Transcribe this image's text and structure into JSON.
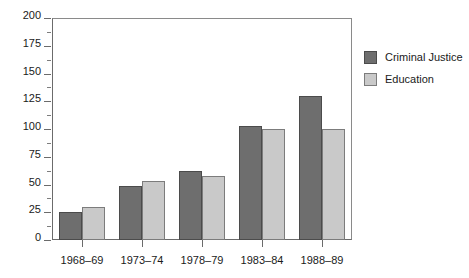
{
  "chart_data": {
    "type": "bar",
    "title": "",
    "subtitle": "",
    "xlabel": "",
    "ylabel": "",
    "ylim": [
      0,
      200
    ],
    "y_ticks": [
      0,
      25,
      50,
      75,
      100,
      125,
      150,
      175,
      200
    ],
    "y_tick_labels": [
      "0",
      "25",
      "50",
      "75",
      "100",
      "125",
      "150",
      "175",
      "200"
    ],
    "y_minor_tick_step": 12.5,
    "grid": false,
    "legend_position": "right",
    "categories": [
      "1968–69",
      "1973–74",
      "1978–79",
      "1983–84",
      "1988–89"
    ],
    "series": [
      {
        "name": "Criminal Justice",
        "color": "#6e6e6e",
        "values": [
          25,
          49,
          62,
          103,
          130
        ]
      },
      {
        "name": "Education",
        "color": "#c9c9c9",
        "values": [
          30,
          53,
          58,
          100,
          100
        ]
      }
    ]
  },
  "legend": {
    "items": [
      {
        "label": "Criminal Justice"
      },
      {
        "label": "Education"
      }
    ]
  }
}
